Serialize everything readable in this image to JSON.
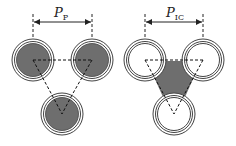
{
  "diagram": {
    "left_panel": {
      "pitch_label": "P",
      "pitch_subscript": "P",
      "fill": "filled-core",
      "circles": [
        {
          "name": "top-left",
          "cx": 33,
          "cy": 60
        },
        {
          "name": "top-right",
          "cx": 92,
          "cy": 60
        },
        {
          "name": "bottom",
          "cx": 62,
          "cy": 114
        }
      ]
    },
    "right_panel": {
      "pitch_label": "P",
      "pitch_subscript": "IC",
      "fill": "filled-interstitial",
      "circles": [
        {
          "name": "top-left",
          "cx": 145,
          "cy": 60
        },
        {
          "name": "top-right",
          "cx": 203,
          "cy": 60
        },
        {
          "name": "bottom",
          "cx": 174,
          "cy": 114
        }
      ]
    },
    "colors": {
      "fill": "#6e6e6e",
      "stroke": "#333333",
      "background": "#ffffff"
    }
  }
}
